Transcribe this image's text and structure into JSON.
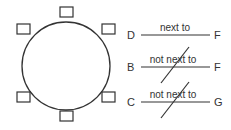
{
  "table": {
    "seats": [
      {
        "id": "top",
        "x": 60,
        "y": 7
      },
      {
        "id": "upper-left",
        "x": 17,
        "y": 24
      },
      {
        "id": "upper-right",
        "x": 102,
        "y": 24
      },
      {
        "id": "lower-left",
        "x": 17,
        "y": 92
      },
      {
        "id": "lower-right",
        "x": 102,
        "y": 92
      },
      {
        "id": "bottom",
        "x": 60,
        "y": 111
      }
    ]
  },
  "clues": [
    {
      "left": "D",
      "relation": "next to",
      "right": "F",
      "negated": false
    },
    {
      "left": "B",
      "relation": "not next to",
      "right": "F",
      "negated": true
    },
    {
      "left": "C",
      "relation": "not next to",
      "right": "G",
      "negated": true
    }
  ],
  "colors": {
    "stroke": "#333333",
    "background": "#ffffff"
  }
}
